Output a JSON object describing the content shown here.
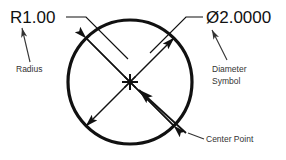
{
  "drawing": {
    "title": "Circle dimensioning reference",
    "background_color": "#ffffff",
    "line_color": "#111111",
    "note_color": "#333333",
    "dimensions": {
      "radius_label": "R1.00",
      "diameter_label": "Ø2.0000"
    },
    "annotations": {
      "radius_note": "Radius",
      "diameter_note_line1": "Diameter",
      "diameter_note_line2": "Symbol",
      "center_note": "Center Point"
    },
    "geometry": {
      "circle_center_x": 130,
      "circle_center_y": 82,
      "circle_radius": 62,
      "circle_stroke_width": 3.2
    },
    "icons": {
      "center_marker": "asterisk-center-mark",
      "radius_arrow": "arrow-up-icon",
      "diameter_arrow": "arrow-up-left-icon",
      "center_arrow": "arrow-up-left-icon",
      "dim_arrow_nw": "arrow-northwest-icon",
      "dim_arrow_ne": "arrow-northeast-icon",
      "dim_arrow_sw": "arrow-southwest-icon"
    }
  }
}
